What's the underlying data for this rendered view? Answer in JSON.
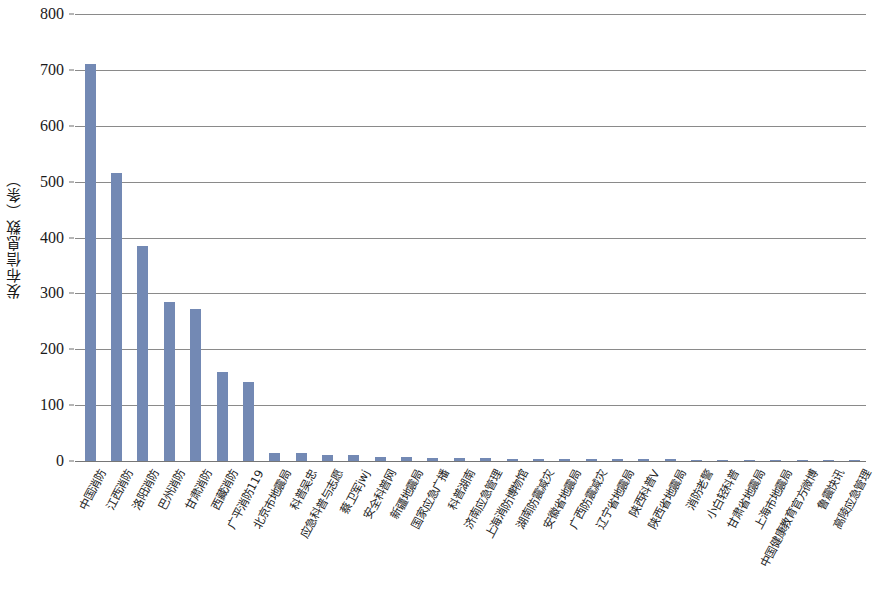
{
  "chart_data": {
    "type": "bar",
    "title": "",
    "xlabel": "",
    "ylabel": "发布信息数（条）",
    "ylim": [
      0,
      800
    ],
    "ytick_labels": [
      "800",
      "700",
      "600",
      "500",
      "400",
      "300",
      "200",
      "100",
      "0"
    ],
    "ytick_values": [
      800,
      700,
      600,
      500,
      400,
      300,
      200,
      100,
      0
    ],
    "grid": true,
    "legend": "none",
    "bar_color": "#7389b4",
    "gridline_color": "#8a8a8a",
    "categories": [
      "中国消防",
      "江西消防",
      "洛阳消防",
      "巴州消防",
      "甘肃消防",
      "西藏消防",
      "广平消防119",
      "北京市地震局",
      "科普吴忠",
      "应急科普与志愿",
      "蔡卫军jwj",
      "安全科普网",
      "新疆地震局",
      "国家应急广播",
      "科普湖南",
      "济南应急管理",
      "上海消防博物馆",
      "湖南防震减灾",
      "安徽省地震局",
      "广西防震减灾",
      "辽宁省地震局",
      "陕西科普V",
      "陕西省地震局",
      "消防老警",
      "小白轻科普",
      "甘肃省地震局",
      "上海市地震局",
      "中国健康教育官方微博",
      "鲁震快讯",
      "高陵应急管理"
    ],
    "values": [
      710,
      515,
      385,
      285,
      272,
      160,
      142,
      15,
      14,
      11,
      10,
      8,
      7,
      6,
      6,
      5,
      4,
      4,
      4,
      3,
      3,
      3,
      3,
      2,
      2,
      2,
      2,
      1,
      1,
      1
    ]
  }
}
